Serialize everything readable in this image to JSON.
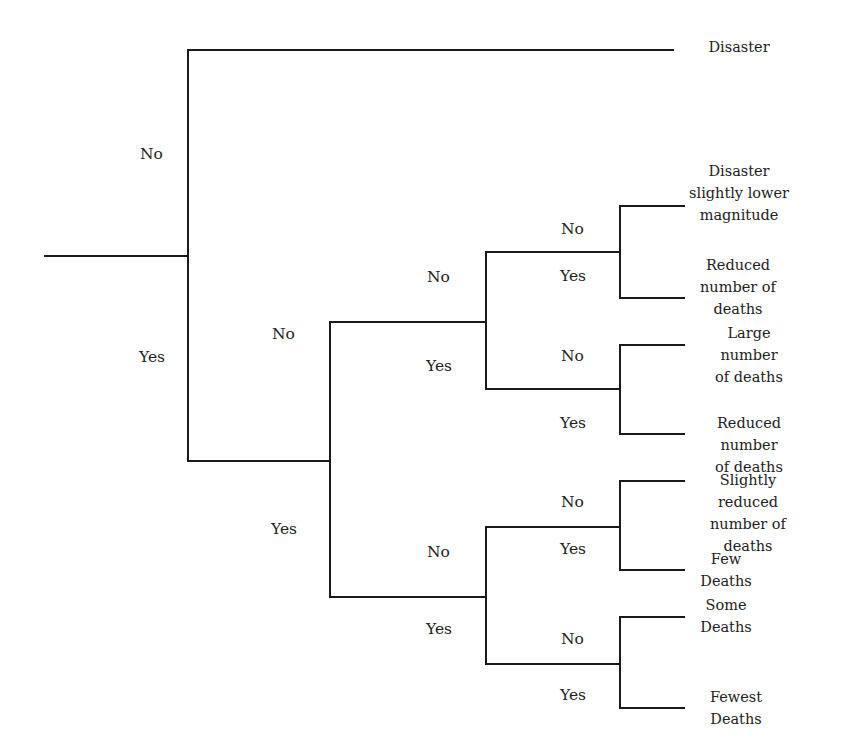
{
  "diagram": {
    "type": "decision-tree",
    "root": {
      "children": [
        {
          "edge_label": "No",
          "outcome": "Disaster"
        },
        {
          "edge_label": "Yes",
          "children": [
            {
              "edge_label": "No",
              "children": [
                {
                  "edge_label": "No",
                  "children": [
                    {
                      "edge_label": "No",
                      "outcome": "Disaster\nslightly lower\nmagnitude"
                    },
                    {
                      "edge_label": "Yes",
                      "outcome": "Reduced\nnumber of\ndeaths"
                    }
                  ]
                },
                {
                  "edge_label": "Yes",
                  "children": [
                    {
                      "edge_label": "No",
                      "outcome": "Large number\nof deaths"
                    },
                    {
                      "edge_label": "Yes",
                      "outcome": "Reduced number\nof deaths"
                    }
                  ]
                }
              ]
            },
            {
              "edge_label": "Yes",
              "children": [
                {
                  "edge_label": "No",
                  "children": [
                    {
                      "edge_label": "No",
                      "outcome": "Slightly reduced\nnumber of deaths"
                    },
                    {
                      "edge_label": "Yes",
                      "outcome": "Few\nDeaths"
                    }
                  ]
                },
                {
                  "edge_label": "Yes",
                  "children": [
                    {
                      "edge_label": "No",
                      "outcome": "Some\nDeaths"
                    },
                    {
                      "edge_label": "Yes",
                      "outcome": "Fewest\nDeaths"
                    }
                  ]
                }
              ]
            }
          ]
        }
      ]
    }
  },
  "labels": {
    "l1_no": "No",
    "l1_yes": "Yes",
    "l2_no": "No",
    "l2_yes": "Yes",
    "l3a_no": "No",
    "l3a_yes": "Yes",
    "l3b_no": "No",
    "l3b_yes": "Yes",
    "l4a_no": "No",
    "l4a_yes": "Yes",
    "l4b_no": "No",
    "l4b_yes": "Yes",
    "l4c_no": "No",
    "l4c_yes": "Yes",
    "l4d_no": "No",
    "l4d_yes": "Yes"
  },
  "outcomes": {
    "o1": "Disaster",
    "o2": "Disaster\nslightly lower\nmagnitude",
    "o3": "Reduced\nnumber of\ndeaths",
    "o4": "Large number\nof deaths",
    "o5": "Reduced number\nof deaths",
    "o6": "Slightly reduced\nnumber of deaths",
    "o7": "Few\nDeaths",
    "o8": "Some\nDeaths",
    "o9": "Fewest\nDeaths"
  },
  "colors": {
    "line": "#1a1a1a",
    "text": "#222222",
    "background": "#ffffff"
  }
}
